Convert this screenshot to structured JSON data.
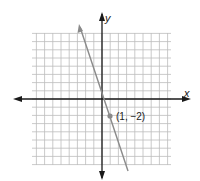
{
  "chart_data": {
    "type": "line",
    "title": "",
    "xlabel": "x",
    "ylabel": "y",
    "grid": true,
    "xlim": [
      -9,
      9
    ],
    "ylim": [
      -8,
      8
    ],
    "series": [
      {
        "name": "line",
        "equation": "y = -3x + 1",
        "x": [
          -2.5,
          2.5
        ],
        "y": [
          8.5,
          -6.5
        ]
      }
    ],
    "points": [
      {
        "x": 1,
        "y": -2,
        "label": "(1, −2)"
      }
    ]
  },
  "labels": {
    "x_axis": "x",
    "y_axis": "y",
    "point": "(1, −2)"
  },
  "colors": {
    "grid": "#bdbdbd",
    "axis": "#1a1a1a",
    "line": "#8a8a8a",
    "point": "#8a8a8a"
  }
}
